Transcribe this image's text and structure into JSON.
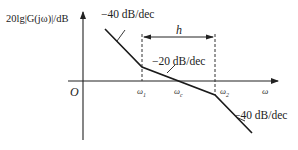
{
  "diagram": {
    "type": "bode-magnitude-asymptote",
    "y_axis_label": "20lg|G(jω)|/dB",
    "x_axis_label": "ω",
    "origin_label": "O",
    "x_ticks": [
      {
        "id": "w1",
        "base": "ω",
        "sub": "1"
      },
      {
        "id": "wc",
        "base": "ω",
        "sub": "c"
      },
      {
        "id": "w2",
        "base": "ω",
        "sub": "2"
      }
    ],
    "slopes": [
      {
        "segment": "before ω1",
        "label": "−40 dB/dec"
      },
      {
        "segment": "ω1 to ω2",
        "label": "−20 dB/dec"
      },
      {
        "segment": "after ω2",
        "label": "−40 dB/dec"
      }
    ],
    "bandwidth_label": "h",
    "colors": {
      "line": "#1a1a1a",
      "axis": "#222222",
      "dashed": "#333333",
      "background": "#ffffff"
    }
  }
}
